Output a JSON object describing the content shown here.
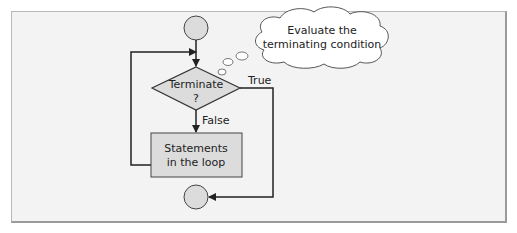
{
  "diagram": {
    "type": "flowchart",
    "nodes": [
      {
        "id": "start",
        "shape": "circle",
        "label": ""
      },
      {
        "id": "decision",
        "shape": "diamond",
        "label_line1": "Terminate",
        "label_line2": "?"
      },
      {
        "id": "body",
        "shape": "rectangle",
        "label_line1": "Statements",
        "label_line2": "in the loop"
      },
      {
        "id": "end",
        "shape": "circle",
        "label": ""
      }
    ],
    "edges": [
      {
        "from": "start",
        "to": "decision",
        "label": ""
      },
      {
        "from": "decision",
        "to": "body",
        "label": "False"
      },
      {
        "from": "body",
        "to": "decision",
        "label": ""
      },
      {
        "from": "decision",
        "to": "end",
        "label": "True"
      }
    ],
    "callout": {
      "shape": "thought-cloud",
      "line1": "Evaluate the",
      "line2": "terminating condition",
      "points_to": "decision"
    },
    "colors": {
      "node_fill": "#dcdcdc",
      "stroke": "#333333",
      "background": "#f3f3f3"
    }
  }
}
